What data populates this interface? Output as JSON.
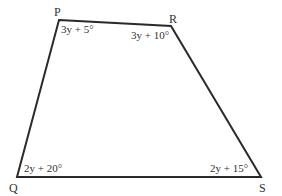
{
  "diagram": {
    "type": "quadrilateral",
    "stroke_color": "#2a2a2a",
    "vertices": [
      {
        "name": "P",
        "x": 59,
        "y": 20,
        "label_x": 54,
        "label_y": 16
      },
      {
        "name": "R",
        "x": 171,
        "y": 26,
        "label_x": 169,
        "label_y": 23
      },
      {
        "name": "S",
        "x": 261,
        "y": 177,
        "label_x": 259,
        "label_y": 192
      },
      {
        "name": "Q",
        "x": 17,
        "y": 177,
        "label_x": 9,
        "label_y": 192
      }
    ],
    "angles": [
      {
        "vertex": "P",
        "expression": "3y + 5°",
        "x": 61,
        "y": 33
      },
      {
        "vertex": "R",
        "expression": "3y + 10°",
        "x": 131,
        "y": 39
      },
      {
        "vertex": "Q",
        "expression": "2y + 20°",
        "x": 24,
        "y": 172
      },
      {
        "vertex": "S",
        "expression": "2y + 15°",
        "x": 210,
        "y": 172
      }
    ]
  }
}
